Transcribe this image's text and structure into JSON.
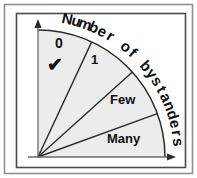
{
  "figure": {
    "type": "quarter-circle fan diagram",
    "outer_frame_color": "#8f8f93",
    "inner_frame_color": "#4a4a4a",
    "fill_color": "#ececec",
    "line_color": "#2b2b2b",
    "text_color": "#101010",
    "background_color": "#ffffff"
  },
  "arc_title": {
    "text": "Number of bystanders",
    "chars": [
      "N",
      "u",
      "m",
      "b",
      "e",
      "r",
      " ",
      "o",
      "f",
      " ",
      "b",
      "y",
      "s",
      "t",
      "a",
      "n",
      "d",
      "e",
      "r",
      "s"
    ]
  },
  "sectors": [
    {
      "label": "0",
      "marked": true,
      "mark": "✔"
    },
    {
      "label": "1",
      "marked": false,
      "mark": ""
    },
    {
      "label": "Few",
      "marked": false,
      "mark": ""
    },
    {
      "label": "Many",
      "marked": false,
      "mark": ""
    }
  ],
  "axes": {
    "vertical": {
      "name": "vertical-axis",
      "arrow": "up"
    },
    "horizontal": {
      "name": "horizontal-axis",
      "arrow": "right"
    }
  },
  "chart_data": {
    "type": "pie",
    "subtitle": "",
    "xlabel": "",
    "ylabel": "",
    "orientation": "quarter-circle fan, origin at bottom-left",
    "total_sweep_degrees": 90,
    "categories": [
      "0",
      "1",
      "Few",
      "Many"
    ],
    "values": [
      25,
      23,
      22,
      20
    ],
    "sector_start_angles_deg": [
      90,
      65,
      42,
      20
    ],
    "sector_end_angles_deg": [
      65,
      42,
      20,
      0
    ],
    "annotations": [
      {
        "sector": "0",
        "symbol": "checkmark",
        "meaning": "selected"
      }
    ],
    "legend_position": "none",
    "grid": false
  }
}
